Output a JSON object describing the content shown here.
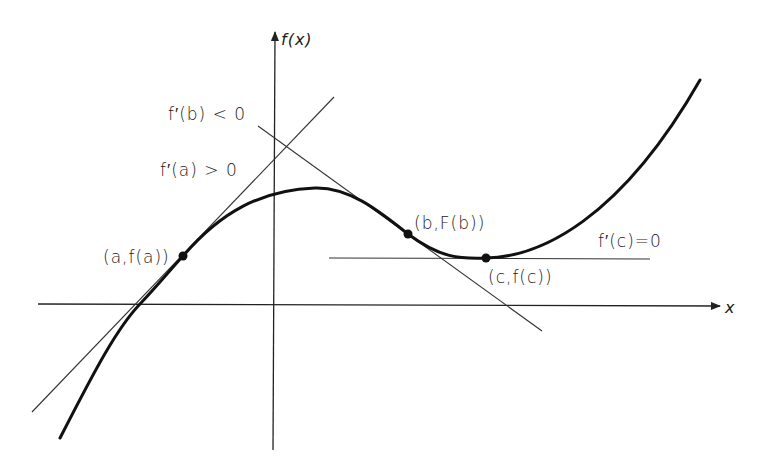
{
  "diagram": {
    "type": "function graph with tangent lines",
    "axes": {
      "x_label": "x",
      "y_label": "f(x)"
    },
    "points": [
      {
        "id": "a",
        "label": "(a,f(a))"
      },
      {
        "id": "b",
        "label": "(b,F(b))"
      },
      {
        "id": "c",
        "label": "(c,f(c))"
      }
    ],
    "tangent_labels": {
      "a": "f′(a) > 0",
      "b": "f′(b) < 0",
      "c": "f′(c)=0"
    },
    "colors": {
      "curve": "#111111",
      "axes": "#222222",
      "tangents": "#333333",
      "background": "#ffffff"
    }
  }
}
